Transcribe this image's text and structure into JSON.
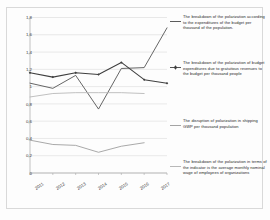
{
  "chart_data": {
    "type": "line",
    "title": "",
    "xlabel": "",
    "ylabel": "",
    "x": [
      "2011",
      "2012",
      "2013",
      "2014",
      "2015",
      "2016",
      "2017"
    ],
    "categories": [
      "2011",
      "2012",
      "2013",
      "2014",
      "2015",
      "2016",
      "2017"
    ],
    "ylim": [
      0,
      1.8
    ],
    "yticks": [
      "0",
      "0,2",
      "0,4",
      "0,6",
      "0,8",
      "1",
      "1,2",
      "1,4",
      "1,6",
      "1,8"
    ],
    "ytick_values": [
      0,
      0.2,
      0.4,
      0.6,
      0.8,
      1.0,
      1.2,
      1.4,
      1.6,
      1.8
    ],
    "grid": true,
    "legend_position": "right",
    "series": [
      {
        "name": "The breakdown of the polarization according to the expenditures of the budget per thousand of the population.",
        "short_name": "budget-expenditures-per-thousand",
        "color": "#4a4a4a",
        "marker": "none",
        "values": [
          1.04,
          0.98,
          1.13,
          0.74,
          1.21,
          1.22,
          1.68
        ]
      },
      {
        "name": "The breakdown of the polarization of budget expenditures due to gratuitous revenues to the budget per thousand people",
        "short_name": "gratuitous-revenues-per-thousand",
        "color": "#3f3f3f",
        "marker": "diamond",
        "values": [
          1.16,
          1.11,
          1.16,
          1.14,
          1.28,
          1.08,
          1.04
        ]
      },
      {
        "name": "The disruption of polarization in shipping GWP per thousand population",
        "short_name": "shipping-gwp-per-thousand",
        "color": "#b5b5b5",
        "marker": "none",
        "values": [
          0.88,
          0.92,
          0.93,
          0.93,
          0.93,
          0.92,
          null
        ]
      },
      {
        "name": "The breakdown of the polarization in terms of the indicator is the average monthly nominal wage of employees of organizations",
        "short_name": "average-monthly-nominal-wage",
        "color": "#9a9a9a",
        "marker": "none",
        "values": [
          0.38,
          0.33,
          0.32,
          0.24,
          0.31,
          0.35,
          null
        ]
      }
    ]
  },
  "legend": {
    "entries": [
      {
        "label": "The breakdown of the polarization according to the expenditures of the budget per thousand of the population.",
        "swatch": "line-plain-dark",
        "color": "#4a4a4a"
      },
      {
        "label": "The breakdown of the polarization of budget expenditures due to gratuitous revenues to the budget per thousand people",
        "swatch": "line-with-diamond-marker",
        "color": "#3f3f3f"
      },
      {
        "label": "The disruption of polarization in shipping GWP per thousand population",
        "swatch": "line-plain-gray",
        "color": "#9a9a9a"
      },
      {
        "label": "The breakdown of the polarization in terms of the indicator is the average monthly nominal wage of employees of organizations",
        "swatch": "line-plain-light-gray",
        "color": "#b0b0b0"
      }
    ]
  },
  "axes": {
    "y_labels": [
      "1,8",
      "1,6",
      "1,4",
      "1,2",
      "1",
      "0,8",
      "0,6",
      "0,4",
      "0,2",
      "0"
    ],
    "x_labels": [
      "2011",
      "2012",
      "2013",
      "2014",
      "2015",
      "2016",
      "2017"
    ]
  }
}
